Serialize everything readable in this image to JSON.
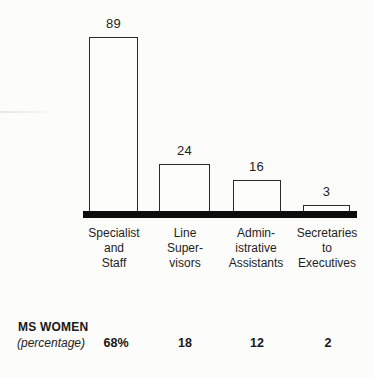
{
  "chart_data": {
    "type": "bar",
    "title": "",
    "xlabel": "",
    "ylabel": "",
    "ylim": [
      0,
      95
    ],
    "grid": false,
    "legend": "none",
    "categories": [
      "Specialist and Staff",
      "Line Supervisors",
      "Administrative Assistants",
      "Secretaries to Executives"
    ],
    "category_display_lines": [
      "Specialist\nand\nStaff",
      "Line\nSuper-\nvisors",
      "Admin-\nistrative\nAssistants",
      "Secretaries\nto\nExecutives"
    ],
    "values": [
      89,
      24,
      16,
      3
    ],
    "bar_value_labels": [
      "89",
      "24",
      "16",
      "3"
    ],
    "bar_fill": "#fdfdfc",
    "bar_stroke": "#2a2a2a",
    "baseline_color": "#0d0d0d",
    "background_color": "#fcfcfa",
    "secondary_row": {
      "label": "MS WOMEN",
      "sublabel": "(percentage)",
      "values": [
        68,
        18,
        12,
        2
      ],
      "display_values": [
        "68%",
        "18",
        "12",
        "2"
      ]
    }
  }
}
